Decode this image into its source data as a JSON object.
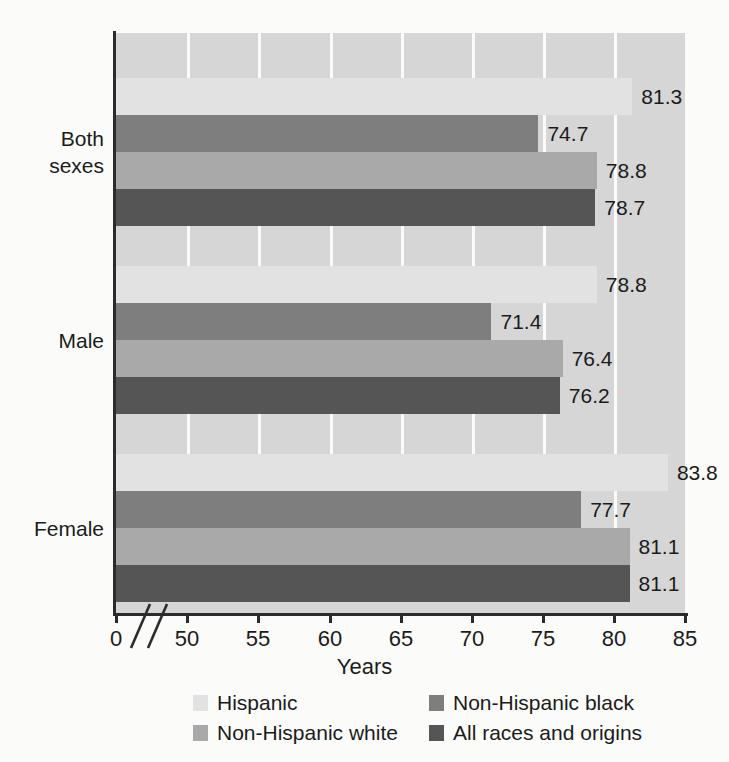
{
  "chart_data": {
    "type": "bar",
    "orientation": "horizontal",
    "title": "",
    "xlabel": "Years",
    "ylabel": "",
    "xlim": [
      48.5,
      85
    ],
    "axis_break": true,
    "xticks": [
      {
        "label": "0",
        "value": 0,
        "px": 116
      },
      {
        "label": "50",
        "value": 50,
        "px": 187
      },
      {
        "label": "55",
        "value": 55,
        "px": 258
      },
      {
        "label": "60",
        "value": 60,
        "px": 330
      },
      {
        "label": "65",
        "value": 65,
        "px": 401
      },
      {
        "label": "70",
        "value": 70,
        "px": 472
      },
      {
        "label": "75",
        "value": 75,
        "px": 543
      },
      {
        "label": "80",
        "value": 80,
        "px": 614
      },
      {
        "label": "85",
        "value": 85,
        "px": 685
      }
    ],
    "gridlines_px": [
      187,
      258,
      330,
      401,
      472,
      543,
      614
    ],
    "grid": true,
    "legend_position": "bottom",
    "categories": [
      "Both sexes",
      "Male",
      "Female"
    ],
    "series": [
      {
        "name": "Hispanic",
        "color": "#e2e2e2",
        "values": [
          81.3,
          78.8,
          83.8
        ]
      },
      {
        "name": "Non-Hispanic black",
        "color": "#7e7e7e",
        "values": [
          74.7,
          71.4,
          77.7
        ]
      },
      {
        "name": "Non-Hispanic white",
        "color": "#a9a9a9",
        "values": [
          78.8,
          76.4,
          81.1
        ]
      },
      {
        "name": "All races and origins",
        "color": "#555555",
        "values": [
          78.7,
          76.2,
          81.1
        ]
      }
    ]
  },
  "axis": {
    "xlabel": "Years",
    "ticks": [
      "0",
      "50",
      "55",
      "60",
      "65",
      "70",
      "75",
      "80",
      "85"
    ],
    "categories": [
      {
        "line1": "Both",
        "line2": "sexes"
      },
      {
        "line1": "Male",
        "line2": ""
      },
      {
        "line1": "Female",
        "line2": ""
      }
    ]
  },
  "legend": {
    "items": [
      {
        "label": "Hispanic",
        "color": "#e2e2e2"
      },
      {
        "label": "Non-Hispanic black",
        "color": "#7e7e7e"
      },
      {
        "label": "Non-Hispanic white",
        "color": "#a9a9a9"
      },
      {
        "label": "All races and origins",
        "color": "#555555"
      }
    ]
  },
  "bar_labels": {
    "both_sexes": [
      "81.3",
      "74.7",
      "78.8",
      "78.7"
    ],
    "male": [
      "78.8",
      "71.4",
      "76.4",
      "76.2"
    ],
    "female": [
      "83.8",
      "77.7",
      "81.1",
      "81.1"
    ]
  },
  "colors": {
    "plot_background": "#d6d6d6",
    "page_background": "#fbfbfa",
    "axis": "#2b2b2b",
    "text": "#1b1b1b",
    "gridline": "#fbfbfa"
  }
}
